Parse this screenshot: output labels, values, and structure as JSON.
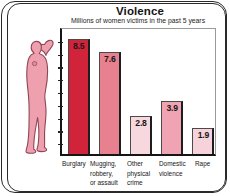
{
  "chart_data": {
    "type": "bar",
    "title": "Violence",
    "subtitle": "Millions of women victims in the past 5 years",
    "xlabel": "",
    "ylabel": "",
    "ylim": [
      0,
      9.5
    ],
    "grid": false,
    "legend": "none",
    "axis_style": {
      "y_tick_count": 9,
      "y_tick_labels_visible": false,
      "x_tick_labels_visible": true
    },
    "categories": [
      "Burglary",
      "Mugging, robbery, or assault",
      "Other physical crime",
      "Domestic violence",
      "Rape"
    ],
    "category_lines": [
      [
        "Burglary"
      ],
      [
        "Mugging,",
        "robbery,",
        "or assault"
      ],
      [
        "Other",
        "physical",
        "crime"
      ],
      [
        "Domestic",
        "violence"
      ],
      [
        "Rape"
      ]
    ],
    "values": [
      8.5,
      7.6,
      2.8,
      3.9,
      1.9
    ],
    "value_labels": [
      "8.5",
      "7.6",
      "2.8",
      "3.9",
      "1.9"
    ],
    "bar_colors": [
      "#D1243A",
      "#E7818F",
      "#F7D8DE",
      "#EFA3B3",
      "#F6D3DA"
    ]
  },
  "illustration": {
    "name": "woman-silhouette",
    "fill_color": "#EFA0AF",
    "outline_color": "#8E4655",
    "description": "pink silhouette of a woman with one arm raised"
  },
  "colors": {
    "frame": "#2a2a2a",
    "axis": "#151515",
    "plot_border_light": "#9a9a9a",
    "text": "#141414",
    "background": "#ffffff"
  }
}
